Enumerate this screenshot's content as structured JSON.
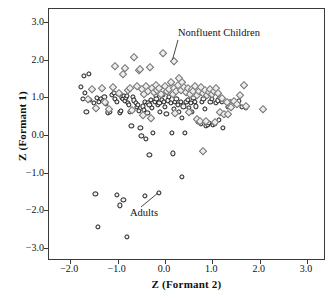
{
  "chart_data": {
    "type": "scatter",
    "title": "",
    "xlabel": "Z (Formant 2)",
    "ylabel": "Z (Formant 1)",
    "xlim": [
      -2.45,
      3.4
    ],
    "ylim": [
      -3.35,
      3.35
    ],
    "xticks": [
      -2.0,
      -1.0,
      0.0,
      1.0,
      2.0,
      3.0
    ],
    "xticklabels": [
      "−2.0",
      "−1.0",
      "0.0",
      "1.0",
      "2.0",
      "3.0"
    ],
    "yticks": [
      -3.0,
      -2.0,
      -1.0,
      0.0,
      1.0,
      2.0,
      3.0
    ],
    "yticklabels": [
      "−3.0",
      "−2.0",
      "−1.0",
      "0.0",
      "1.0",
      "2.0",
      "3.0"
    ],
    "grid": false,
    "legend": "none",
    "annotations": [
      {
        "text": "Nonfluent Children",
        "x": 0.35,
        "y": 2.55,
        "points_to": {
          "x": 0.18,
          "y": 1.98
        }
      },
      {
        "text": "Adults",
        "x": -0.27,
        "y": -2.32,
        "points_to": {
          "x": -0.13,
          "y": -1.57
        }
      }
    ],
    "series": [
      {
        "name": "Adults",
        "marker": "circle",
        "color": "#151515",
        "points": [
          [
            -1.72,
            1.58
          ],
          [
            -1.6,
            1.63
          ],
          [
            -1.78,
            1.27
          ],
          [
            -1.7,
            1.12
          ],
          [
            -1.73,
            0.95
          ],
          [
            -1.66,
            0.62
          ],
          [
            -1.58,
            0.93
          ],
          [
            -1.5,
            0.86
          ],
          [
            -1.44,
            0.99
          ],
          [
            -1.4,
            0.88
          ],
          [
            -1.36,
            0.95
          ],
          [
            -1.31,
            0.9
          ],
          [
            -1.28,
            1.02
          ],
          [
            -1.24,
            0.83
          ],
          [
            -1.2,
            0.6
          ],
          [
            -1.16,
            0.62
          ],
          [
            -1.12,
            1.07
          ],
          [
            -1.08,
            1.12
          ],
          [
            -1.05,
            0.96
          ],
          [
            -1.02,
            0.88
          ],
          [
            -0.99,
            1.09
          ],
          [
            -0.96,
            0.6
          ],
          [
            -0.93,
            0.63
          ],
          [
            -0.9,
            1.0
          ],
          [
            -0.88,
            0.95
          ],
          [
            -0.86,
            1.05
          ],
          [
            -0.84,
            0.9
          ],
          [
            -0.82,
            0.99
          ],
          [
            -0.8,
            1.03
          ],
          [
            -0.78,
            0.86
          ],
          [
            -0.76,
            0.79
          ],
          [
            -0.74,
            0.62
          ],
          [
            -0.71,
            0.25
          ],
          [
            -0.68,
            1.02
          ],
          [
            -0.65,
            0.92
          ],
          [
            -0.62,
            0.86
          ],
          [
            -0.6,
            0.74
          ],
          [
            -0.57,
            0.81
          ],
          [
            -0.55,
            0.63
          ],
          [
            -0.52,
            0.18
          ],
          [
            -0.5,
            -0.02
          ],
          [
            -0.47,
            0.76
          ],
          [
            -0.44,
            0.66
          ],
          [
            -0.42,
            0.88
          ],
          [
            -0.4,
            -0.11
          ],
          [
            -0.37,
            0.59
          ],
          [
            -0.35,
            0.86
          ],
          [
            -0.33,
            0.79
          ],
          [
            -0.3,
            0.93
          ],
          [
            -0.28,
            0.71
          ],
          [
            -0.25,
            0.05
          ],
          [
            -0.22,
            0.88
          ],
          [
            -0.2,
            1.05
          ],
          [
            -0.18,
            0.96
          ],
          [
            -0.15,
            0.79
          ],
          [
            -0.12,
            0.86
          ],
          [
            -0.1,
            0.62
          ],
          [
            -0.07,
            0.94
          ],
          [
            -0.05,
            1.08
          ],
          [
            -0.02,
            0.88
          ],
          [
            0.0,
            0.75
          ],
          [
            0.03,
            0.56
          ],
          [
            0.06,
            0.92
          ],
          [
            0.09,
            1.02
          ],
          [
            0.12,
            0.85
          ],
          [
            0.15,
            0.06
          ],
          [
            0.18,
            0.7
          ],
          [
            0.21,
            0.88
          ],
          [
            0.24,
            0.96
          ],
          [
            0.27,
            0.79
          ],
          [
            0.3,
            0.62
          ],
          [
            0.33,
            0.88
          ],
          [
            0.36,
            0.45
          ],
          [
            0.39,
            0.76
          ],
          [
            0.42,
            0.05
          ],
          [
            0.45,
            0.88
          ],
          [
            0.48,
            0.94
          ],
          [
            0.51,
            0.71
          ],
          [
            0.54,
            0.86
          ],
          [
            0.57,
            0.62
          ],
          [
            0.6,
            0.99
          ],
          [
            0.63,
            0.88
          ],
          [
            0.66,
            0.76
          ],
          [
            0.69,
            0.35
          ],
          [
            0.72,
            0.4
          ],
          [
            0.75,
            0.31
          ],
          [
            0.78,
            0.88
          ],
          [
            0.81,
            0.95
          ],
          [
            0.84,
            0.7
          ],
          [
            0.87,
            0.25
          ],
          [
            0.9,
            0.28
          ],
          [
            0.93,
            0.33
          ],
          [
            0.96,
            0.88
          ],
          [
            0.99,
            0.96
          ],
          [
            1.02,
            0.26
          ],
          [
            1.05,
            0.3
          ],
          [
            1.08,
            0.85
          ],
          [
            1.11,
            0.92
          ],
          [
            1.14,
            0.4
          ],
          [
            1.17,
            0.99
          ],
          [
            1.2,
            0.88
          ],
          [
            1.23,
            0.19
          ],
          [
            1.26,
            0.56
          ],
          [
            1.32,
            0.74
          ],
          [
            1.38,
            0.88
          ],
          [
            1.44,
            0.82
          ],
          [
            1.56,
            0.9
          ],
          [
            1.62,
            0.75
          ],
          [
            1.7,
            0.72
          ],
          [
            -0.33,
            -0.54
          ],
          [
            0.16,
            -0.49
          ],
          [
            0.35,
            -1.12
          ],
          [
            -1.47,
            -1.56
          ],
          [
            -1.42,
            -2.45
          ],
          [
            -1.02,
            -1.6
          ],
          [
            -0.96,
            -1.87
          ],
          [
            -0.88,
            -1.73
          ],
          [
            -0.8,
            -2.7
          ],
          [
            -0.42,
            -1.62
          ],
          [
            -0.13,
            -1.53
          ]
        ]
      },
      {
        "name": "Nonfluent Children",
        "marker": "diamond",
        "color": "#6f6f6f",
        "points": [
          [
            -1.54,
            1.22
          ],
          [
            -1.33,
            1.24
          ],
          [
            -1.1,
            1.27
          ],
          [
            -1.06,
            1.83
          ],
          [
            -0.97,
            1.12
          ],
          [
            -0.88,
            1.62
          ],
          [
            -0.84,
            1.78
          ],
          [
            -0.78,
            1.2
          ],
          [
            -0.74,
            1.26
          ],
          [
            -0.66,
            2.08
          ],
          [
            -0.6,
            1.31
          ],
          [
            -0.55,
            1.73
          ],
          [
            -0.52,
            1.76
          ],
          [
            -0.48,
            1.22
          ],
          [
            -0.45,
            1.1
          ],
          [
            -0.4,
            1.3
          ],
          [
            -0.36,
            1.18
          ],
          [
            -0.32,
            1.82
          ],
          [
            -0.28,
            1.26
          ],
          [
            -0.24,
            1.15
          ],
          [
            -0.2,
            1.34
          ],
          [
            -0.16,
            1.2
          ],
          [
            -0.12,
            1.26
          ],
          [
            -0.08,
            1.1
          ],
          [
            -0.04,
            2.18
          ],
          [
            0.0,
            1.3
          ],
          [
            0.04,
            1.16
          ],
          [
            0.08,
            1.22
          ],
          [
            0.12,
            1.4
          ],
          [
            0.16,
            1.08
          ],
          [
            0.18,
            1.98
          ],
          [
            0.2,
            1.26
          ],
          [
            0.24,
            1.18
          ],
          [
            0.28,
            1.34
          ],
          [
            0.3,
            1.52
          ],
          [
            0.33,
            1.2
          ],
          [
            0.36,
            1.42
          ],
          [
            0.4,
            1.28
          ],
          [
            0.44,
            1.14
          ],
          [
            0.48,
            1.25
          ],
          [
            0.52,
            1.1
          ],
          [
            0.56,
            1.22
          ],
          [
            0.6,
            1.18
          ],
          [
            0.64,
            1.3
          ],
          [
            0.68,
            1.06
          ],
          [
            0.72,
            1.16
          ],
          [
            0.76,
            1.28
          ],
          [
            0.8,
            1.12
          ],
          [
            0.84,
            1.2
          ],
          [
            0.88,
            1.06
          ],
          [
            0.92,
            1.15
          ],
          [
            0.96,
            1.22
          ],
          [
            1.0,
            1.1
          ],
          [
            1.04,
            1.18
          ],
          [
            1.08,
            1.26
          ],
          [
            1.12,
            1.12
          ],
          [
            1.16,
            0.62
          ],
          [
            1.2,
            0.98
          ],
          [
            1.24,
            0.55
          ],
          [
            1.3,
            0.88
          ],
          [
            1.34,
            0.56
          ],
          [
            1.4,
            0.75
          ],
          [
            1.46,
            0.9
          ],
          [
            1.52,
            0.83
          ],
          [
            1.58,
            1.06
          ],
          [
            1.66,
            1.32
          ],
          [
            1.72,
            0.78
          ],
          [
            2.06,
            0.68
          ],
          [
            0.8,
            -0.43
          ],
          [
            -1.62,
            0.95
          ],
          [
            -1.45,
            0.72
          ],
          [
            -1.26,
            0.88
          ],
          [
            -1.18,
            0.7
          ],
          [
            -0.7,
            0.66
          ],
          [
            -0.46,
            0.52
          ],
          [
            -0.3,
            0.44
          ],
          [
            0.22,
            0.58
          ],
          [
            0.5,
            0.62
          ],
          [
            0.68,
            0.42
          ],
          [
            0.74,
            0.36
          ],
          [
            0.86,
            0.38
          ],
          [
            1.06,
            0.35
          ]
        ]
      }
    ]
  }
}
